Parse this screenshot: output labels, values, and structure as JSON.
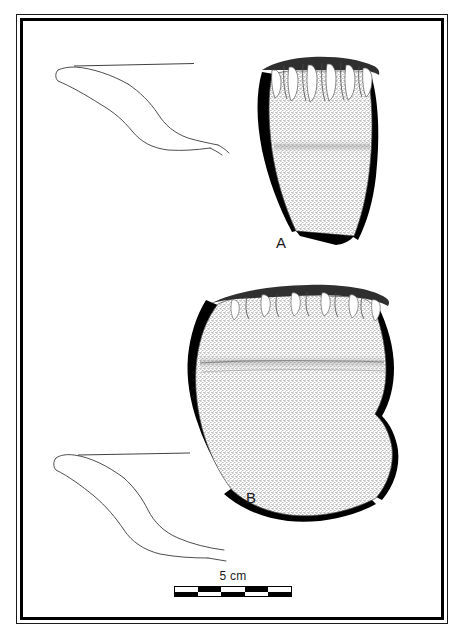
{
  "figure": {
    "type": "archaeological-illustration-plate",
    "background_color": "#ffffff",
    "ink_color": "#000000",
    "frame": {
      "style": "double-rule",
      "outer_stroke_px": 1,
      "inner_stroke_px": 3
    },
    "specimens": [
      {
        "label": "A",
        "label_position": {
          "x": 276,
          "y": 234
        },
        "description": "ceramic rim sherd with finger-impressed scalloped rim",
        "rim_impression_count": 6,
        "profile_orientation": "left",
        "shading": "stipple with heavy black break-edge"
      },
      {
        "label": "B",
        "label_position": {
          "x": 246,
          "y": 489
        },
        "description": "ceramic rim sherd with finger-impressed scalloped rim",
        "rim_impression_count": 6,
        "profile_orientation": "left",
        "shading": "stipple with heavy black break-edge"
      }
    ]
  },
  "scale_bar": {
    "label": "5 cm",
    "segments": 5,
    "rows": 2,
    "pattern": "checkerboard",
    "colors": {
      "dark": "#000000",
      "light": "#ffffff"
    }
  }
}
